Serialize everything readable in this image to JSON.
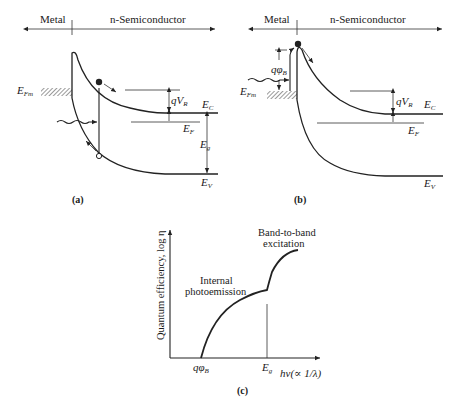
{
  "panel_a": {
    "header_left": "Metal",
    "header_right": "n-Semiconductor",
    "labels": {
      "efm": "E",
      "efm_sub": "Fm",
      "qvr": "qV",
      "qvr_sub": "R",
      "ec": "E",
      "ec_sub": "C",
      "ef": "E",
      "ef_sub": "F",
      "eg": "E",
      "eg_sub": "g",
      "ev": "E",
      "ev_sub": "V"
    },
    "caption": "(a)"
  },
  "panel_b": {
    "header_left": "Metal",
    "header_right": "n-Semiconductor",
    "labels": {
      "qphib": "qφ",
      "qphib_sub": "B",
      "efm": "E",
      "efm_sub": "Fm",
      "qvr": "qV",
      "qvr_sub": "R",
      "ec": "E",
      "ec_sub": "C",
      "ef": "E",
      "ef_sub": "F",
      "ev": "E",
      "ev_sub": "V"
    },
    "caption": "(b)"
  },
  "panel_c": {
    "ylabel": "Quantum efficiency, log η",
    "xlabel": "hν(∝ 1/λ)",
    "tick_qphib": "qφ",
    "tick_qphib_sub": "B",
    "tick_eg": "E",
    "tick_eg_sub": "g",
    "annotation_internal_1": "Internal",
    "annotation_internal_2": "photoemission",
    "annotation_band_1": "Band-to-band",
    "annotation_band_2": "excitation",
    "caption": "(c)"
  }
}
